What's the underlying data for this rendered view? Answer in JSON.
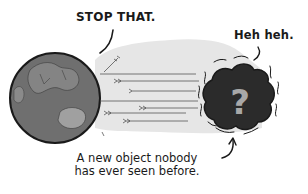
{
  "comic": {
    "earth_speech": "STOP THAT.",
    "object_speech": "Heh heh.",
    "caption_line1": "A new object nobody",
    "caption_line2": "has ever seen before.",
    "object_glyph": "?"
  },
  "colors": {
    "ink": "#1a1a1a",
    "beam": "#e6e6e6",
    "earth_ocean": "#6f6f6f",
    "earth_land": "#9a9a9a",
    "object_body": "#2b2b2b",
    "question_mark": "#a8a8a8"
  }
}
